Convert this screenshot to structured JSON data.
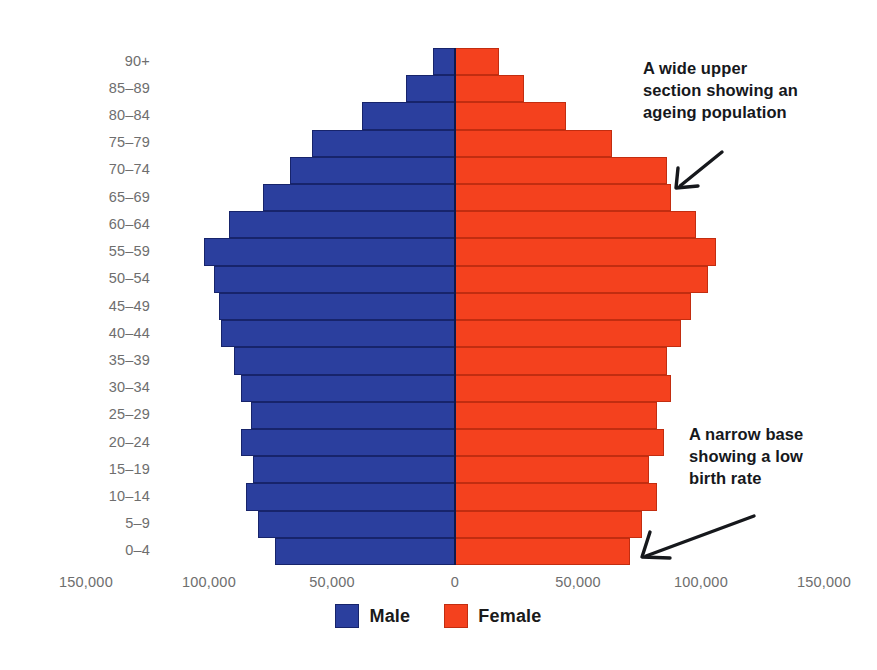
{
  "chart_data": {
    "type": "bar",
    "subtype": "population-pyramid",
    "title": "",
    "xlabel": "",
    "ylabel": "",
    "categories": [
      "90+",
      "85–89",
      "80–84",
      "75–79",
      "70–74",
      "65–69",
      "60–64",
      "55–59",
      "50–54",
      "45–49",
      "40–44",
      "35–39",
      "30–34",
      "25–29",
      "20–24",
      "15–19",
      "10–14",
      "5–9",
      "0–4"
    ],
    "series": [
      {
        "name": "Male",
        "color": "#2b3f9e",
        "direction": "left",
        "values": [
          9000,
          20000,
          38000,
          58000,
          67000,
          78000,
          92000,
          102000,
          98000,
          96000,
          95000,
          90000,
          87000,
          83000,
          87000,
          82000,
          85000,
          80000,
          73000
        ]
      },
      {
        "name": "Female",
        "color": "#f4411e",
        "direction": "right",
        "values": [
          18000,
          28000,
          45000,
          64000,
          86000,
          88000,
          98000,
          106000,
          103000,
          96000,
          92000,
          86000,
          88000,
          82000,
          85000,
          79000,
          82000,
          76000,
          71000
        ]
      }
    ],
    "xlim": [
      -150000,
      150000
    ],
    "xticks": [
      -150000,
      -100000,
      -50000,
      0,
      50000,
      100000,
      150000
    ],
    "xtick_labels": [
      "150,000",
      "100,000",
      "50,000",
      "0",
      "50,000",
      "100,000",
      "150,000"
    ],
    "grid": false,
    "legend_position": "bottom",
    "annotations": [
      {
        "id": "ageing-population",
        "text": "A wide upper section showing an ageing population",
        "lines": [
          "A wide upper",
          "section showing an",
          "ageing population"
        ],
        "arrow": "down-left"
      },
      {
        "id": "low-birth-rate",
        "text": "A narrow base showing a low birth rate",
        "lines": [
          "A narrow base",
          "showing a low",
          "birth rate"
        ],
        "arrow": "down-left"
      }
    ]
  },
  "legend": {
    "items": [
      {
        "label": "Male",
        "color": "#2b3f9e"
      },
      {
        "label": "Female",
        "color": "#f4411e"
      }
    ]
  },
  "colors": {
    "male": "#2b3f9e",
    "female": "#f4411e",
    "axis_text": "#6e6e6e",
    "annotation_text": "#16181c",
    "background": "#ffffff"
  }
}
